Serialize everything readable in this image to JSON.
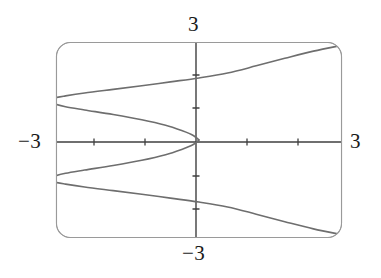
{
  "figure": {
    "name": "graphing-calculator-plot",
    "frame": {
      "shape": "rounded-rectangle",
      "x": 56,
      "y": 42,
      "width": 286,
      "height": 196,
      "corner_radius": 14,
      "stroke_color": "#8a8a8a",
      "stroke_width": 1
    },
    "axis_color": "#3a3a3a",
    "curve_color": "#6e6e6e",
    "background_color": "#ffffff"
  },
  "labels": {
    "top": "3",
    "bottom": "−3",
    "left": "−3",
    "right": "3"
  },
  "chart_data": {
    "type": "line",
    "title": "",
    "xlabel": "",
    "ylabel": "",
    "xlim": [
      -3,
      3
    ],
    "ylim": [
      -3,
      3
    ],
    "grid": false,
    "legend": null,
    "x_tick_labels": [
      "-3",
      "3"
    ],
    "y_tick_labels": [
      "3",
      "-3"
    ],
    "x_ticks": [
      -3,
      -2,
      -1,
      1,
      2,
      3
    ],
    "y_ticks": [
      -3,
      -2,
      -1,
      1,
      2,
      3
    ],
    "tick_mark_length": 5,
    "axes_through_origin": true,
    "series": [
      {
        "name": "upper-branch",
        "comment": "Upper half of the curve: enters from the right edge, sweeps left to a vertex then returns to the origin.",
        "points": [
          [
            3.0,
            2.9
          ],
          [
            2.4,
            2.72
          ],
          [
            1.8,
            2.5
          ],
          [
            1.2,
            2.27
          ],
          [
            0.6,
            2.05
          ],
          [
            0.0,
            1.9
          ],
          [
            -0.6,
            1.78
          ],
          [
            -1.2,
            1.66
          ],
          [
            -1.8,
            1.55
          ],
          [
            -2.4,
            1.44
          ],
          [
            -2.8,
            1.35
          ],
          [
            -3.05,
            1.28
          ],
          [
            -3.12,
            1.21
          ],
          [
            -3.05,
            1.12
          ],
          [
            -2.8,
            1.02
          ],
          [
            -2.4,
            0.92
          ],
          [
            -1.8,
            0.78
          ],
          [
            -1.2,
            0.62
          ],
          [
            -0.7,
            0.45
          ],
          [
            -0.35,
            0.28
          ],
          [
            -0.12,
            0.14
          ],
          [
            0.0,
            0.0
          ]
        ]
      },
      {
        "name": "lower-branch",
        "comment": "Mirror image of the upper branch across the x-axis.",
        "points": [
          [
            0.0,
            0.0
          ],
          [
            -0.12,
            -0.14
          ],
          [
            -0.35,
            -0.28
          ],
          [
            -0.7,
            -0.45
          ],
          [
            -1.2,
            -0.62
          ],
          [
            -1.8,
            -0.78
          ],
          [
            -2.4,
            -0.92
          ],
          [
            -2.8,
            -1.02
          ],
          [
            -3.05,
            -1.12
          ],
          [
            -3.12,
            -1.21
          ],
          [
            -3.05,
            -1.28
          ],
          [
            -2.8,
            -1.35
          ],
          [
            -2.4,
            -1.44
          ],
          [
            -1.8,
            -1.55
          ],
          [
            -1.2,
            -1.66
          ],
          [
            -0.6,
            -1.78
          ],
          [
            0.0,
            -1.9
          ],
          [
            0.6,
            -2.05
          ],
          [
            1.2,
            -2.27
          ],
          [
            1.8,
            -2.5
          ],
          [
            2.4,
            -2.72
          ],
          [
            3.0,
            -2.9
          ]
        ]
      }
    ]
  }
}
